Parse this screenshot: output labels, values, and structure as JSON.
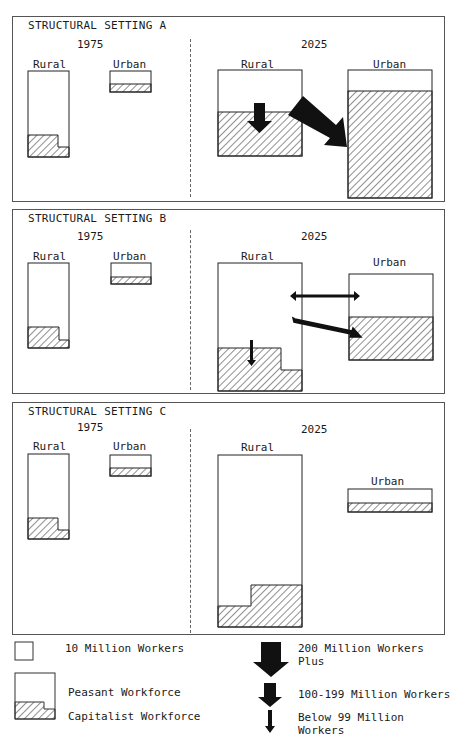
{
  "figure": {
    "panels": [
      {
        "id": "A",
        "title": "STRUCTURAL SETTING A",
        "year_left": "1975",
        "year_right": "2025",
        "rural_label": "Rural",
        "urban_label": "Urban",
        "arrows": [
          {
            "from": "rural-peasant",
            "to": "rural-capitalist",
            "size": "100-199 Million Workers"
          },
          {
            "from": "rural-peasant",
            "to": "urban-capitalist",
            "size": "200 Million Workers Plus"
          }
        ]
      },
      {
        "id": "B",
        "title": "STRUCTURAL SETTING B",
        "year_left": "1975",
        "year_right": "2025",
        "rural_label": "Rural",
        "urban_label": "Urban",
        "arrows": [
          {
            "from": "rural-peasant",
            "to": "rural-capitalist",
            "size": "Below 99 Million Workers"
          },
          {
            "from": "rural-peasant",
            "to": "urban-peasant",
            "size": "Below 99 Million Workers",
            "bidirectional": true
          },
          {
            "from": "rural-peasant",
            "to": "urban-capitalist",
            "size": "Below 99 Million Workers"
          }
        ]
      },
      {
        "id": "C",
        "title": "STRUCTURAL SETTING C",
        "year_left": "1975",
        "year_right": "2025",
        "rural_label": "Rural",
        "urban_label": "Urban",
        "arrows": []
      }
    ],
    "legend": {
      "unit": "10 Million Workers",
      "peasant": "Peasant Workforce",
      "capitalist": "Capitalist Workforce",
      "arrow_large": "200 Million Workers Plus",
      "arrow_medium": "100-199 Million Workers",
      "arrow_small": "Below 99 Million Workers"
    }
  }
}
